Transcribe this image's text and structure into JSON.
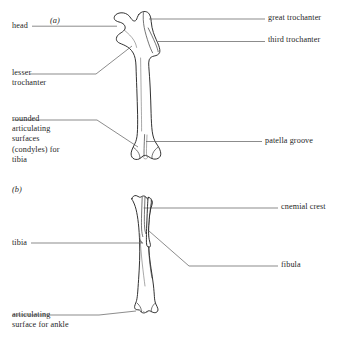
{
  "figure": {
    "panels": [
      {
        "tag": "(a)",
        "subject": "femur"
      },
      {
        "tag": "(b)",
        "subject": "tibiotarsus and fibula"
      }
    ]
  },
  "panel_a": {
    "tag": "(a)",
    "labels": {
      "head": "head",
      "great_trochanter": "great trochanter",
      "third_trochanter": "third trochanter",
      "lesser_trochanter": "lesser\ntrochanter",
      "condyles": "rounded\narticulating\nsurfaces\n(condyles) for\ntibia",
      "patella_groove": "patella groove"
    }
  },
  "panel_b": {
    "tag": "(b)",
    "labels": {
      "cnemial_crest": "cnemial crest",
      "tibia": "tibia",
      "fibula": "fibula",
      "ankle_surface": "articulating\nsurface for ankle"
    }
  },
  "colors": {
    "background": "#ffffff",
    "outline": "#1b1b1b",
    "detail": "#3a3a3a",
    "leader": "#5a5a5a",
    "text": "#1f1f1f"
  }
}
